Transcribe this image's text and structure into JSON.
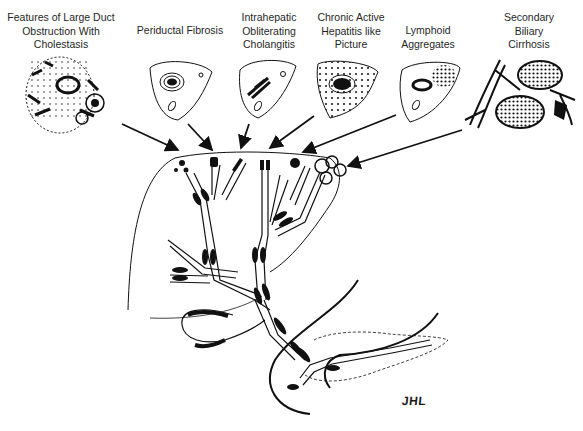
{
  "figure": {
    "type": "medical-illustration",
    "labels": [
      {
        "id": "large-duct",
        "text": "Features of Large Duct\nObstruction With\nCholestasis"
      },
      {
        "id": "periductal",
        "text": "Periductal Fibrosis"
      },
      {
        "id": "intrahepatic",
        "text": "Intrahepatic\nObliterating\nCholangitis"
      },
      {
        "id": "chronic-active",
        "text": "Chronic Active\nHepatitis like\nPicture"
      },
      {
        "id": "lymphoid",
        "text": "Lymphoid\nAggregates"
      },
      {
        "id": "secondary-biliary",
        "text": "Secondary\nBiliary\nCirrhosis"
      }
    ],
    "signature": "JHL",
    "colors": {
      "ink": "#111111",
      "paper": "#ffffff"
    }
  }
}
